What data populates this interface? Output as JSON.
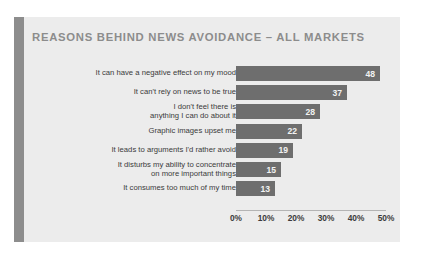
{
  "card": {
    "accent_color": "#8d8d8d",
    "background_color": "#ececec"
  },
  "chart_data": {
    "type": "bar",
    "orientation": "horizontal",
    "title": "REASONS BEHIND NEWS AVOIDANCE – ALL MARKETS",
    "xlabel": "",
    "ylabel": "",
    "xlim": [
      0,
      55
    ],
    "grid": false,
    "legend": null,
    "bar_color": "#6e6e6e",
    "value_label_color": "#f2f2f2",
    "title_color": "#8c8c8c",
    "categories": [
      "It can have a negative effect on my mood",
      "It can't rely on news to be true",
      "I don't feel there is\nanything I can do about it",
      "Graphic images upset me",
      "It leads to arguments I'd rather avoid",
      "It disturbs my ability to concentrate\non more important things",
      "It consumes too much of my time"
    ],
    "values": [
      48,
      37,
      28,
      22,
      19,
      15,
      13
    ],
    "value_labels": [
      "48",
      "37",
      "28",
      "22",
      "19",
      "15",
      "13"
    ],
    "xticks": [
      0,
      10,
      20,
      30,
      40,
      50
    ],
    "xticklabels": [
      "0%",
      "10%",
      "20%",
      "30%",
      "40%",
      "50%"
    ]
  }
}
